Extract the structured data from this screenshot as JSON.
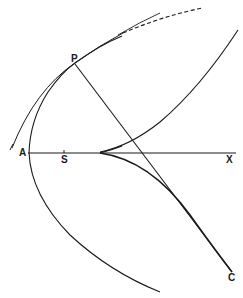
{
  "figure": {
    "labels": {
      "P": "P",
      "A": "A",
      "S": "S",
      "X": "X",
      "C": "C"
    },
    "colors": {
      "stroke": "#1a1a1a",
      "background": "#ffffff"
    }
  }
}
